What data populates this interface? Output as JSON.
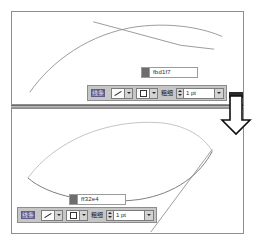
{
  "app": {
    "title": "Line and Fill style editor comparison"
  },
  "panels": [
    {
      "id": "top",
      "name": "upper-drawing-panel",
      "hex": {
        "swatch_color": "#6d6d6d",
        "value": "fbd1f7"
      },
      "toolbar": {
        "style_label": "线条",
        "style_label_selected": true,
        "line_combo_name": "line-style-dropdown",
        "fill_combo_name": "fill-style-dropdown",
        "width_label": "粗细",
        "width_value": "1 pt"
      },
      "strokes": [
        {
          "name": "arc-stroke",
          "type": "arc",
          "color": "#8a8a8a",
          "points": "18,82 38,52 72,28 118,16 168,16 210,24"
        },
        {
          "name": "angular-stroke",
          "type": "polyline",
          "color": "#8a8a8a",
          "points": "82,10 170,34 202,38"
        }
      ]
    },
    {
      "id": "bottom",
      "name": "lower-drawing-panel",
      "hex": {
        "swatch_color": "#6d6d6d",
        "value": "ff32e4"
      },
      "toolbar": {
        "style_label": "线条",
        "style_label_selected": true,
        "line_combo_name": "line-style-dropdown",
        "fill_combo_name": "fill-style-dropdown",
        "width_label": "粗细",
        "width_value": "1 pt"
      },
      "strokes": [
        {
          "name": "upper-arc-stroke",
          "type": "arc",
          "color": "#b4b4b4",
          "points": "16,70 54,30 110,12 160,14 192,32 200,44"
        },
        {
          "name": "lower-arc-stroke",
          "type": "arc",
          "color": "#6e6e6e",
          "points": "16,70 40,86 80,96 130,92 172,72 198,44"
        },
        {
          "name": "diagonal-stroke",
          "type": "line",
          "color": "#8a8a8a",
          "points": "200,42 140,124"
        }
      ]
    }
  ],
  "annotation": {
    "arrow_name": "down-arrow-annotation",
    "direction": "down",
    "fill": "#ffffff",
    "stroke": "#111111"
  },
  "divider": {
    "name": "panel-divider",
    "color": "#b9b9b9"
  }
}
